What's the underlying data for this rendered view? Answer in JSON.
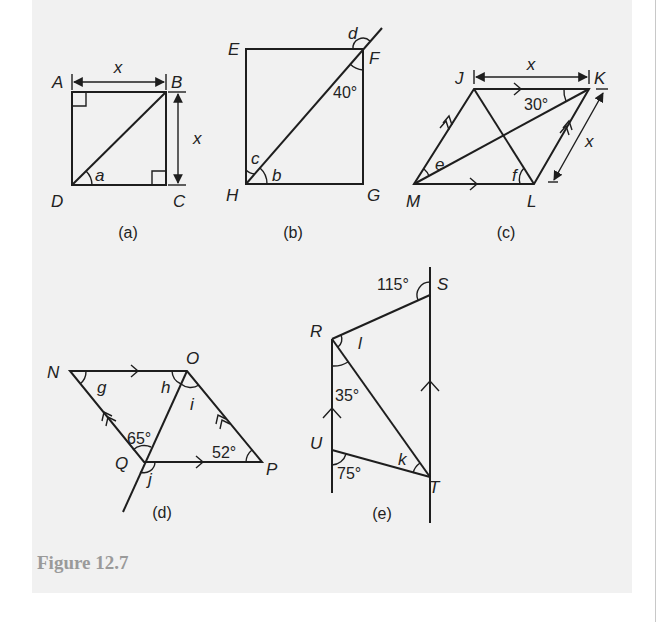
{
  "caption": "Figure 12.7",
  "figures": {
    "a": {
      "sublabel": "(a)",
      "vertices": {
        "A": "A",
        "B": "B",
        "C": "C",
        "D": "D"
      },
      "angles": {
        "a": "a"
      },
      "dimensions": {
        "top": "x",
        "right": "x"
      },
      "right_angles": [
        "A",
        "C"
      ]
    },
    "b": {
      "sublabel": "(b)",
      "vertices": {
        "E": "E",
        "F": "F",
        "G": "G",
        "H": "H"
      },
      "angles": {
        "b": "b",
        "c": "c",
        "d": "d",
        "given": "40°"
      }
    },
    "c": {
      "sublabel": "(c)",
      "vertices": {
        "J": "J",
        "K": "K",
        "L": "L",
        "M": "M"
      },
      "angles": {
        "e": "e",
        "f": "f",
        "given": "30°"
      },
      "dimensions": {
        "top": "x",
        "right": "x"
      }
    },
    "d": {
      "sublabel": "(d)",
      "vertices": {
        "N": "N",
        "O": "O",
        "P": "P",
        "Q": "Q"
      },
      "angles": {
        "g": "g",
        "h": "h",
        "i": "i",
        "j": "j",
        "given_q": "65°",
        "given_p": "52°"
      }
    },
    "e": {
      "sublabel": "(e)",
      "vertices": {
        "R": "R",
        "S": "S",
        "T": "T",
        "U": "U"
      },
      "angles": {
        "k": "k",
        "l": "l",
        "given_s": "115°",
        "given_r": "35°",
        "given_u": "75°"
      }
    }
  }
}
